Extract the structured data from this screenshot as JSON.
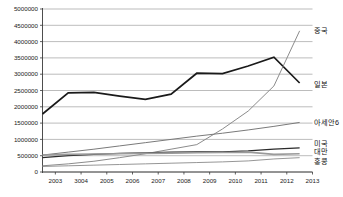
{
  "chart_data": {
    "type": "line",
    "title": "",
    "xlabel": "",
    "ylabel": "",
    "ylim": [
      0,
      5000000
    ],
    "xlim": [
      2002.5,
      2013.0
    ],
    "grid": true,
    "legend_position": "right-inline-labels",
    "ytick_labels": [
      "5000000",
      "4500000",
      "4000000",
      "3500000",
      "3000000",
      "2500000",
      "2000000",
      "1500000",
      "1000000",
      "500000",
      "0"
    ],
    "ytick_values": [
      5000000,
      4500000,
      4000000,
      3500000,
      3000000,
      2500000,
      2000000,
      1500000,
      1000000,
      500000,
      0
    ],
    "xtick_labels": [
      "2003",
      "3004",
      "2005",
      "2006",
      "2007",
      "2008",
      "2009",
      "2010",
      "2011",
      "2012",
      "2013"
    ],
    "xtick_values": [
      2003,
      2004,
      2005,
      2006,
      2007,
      2008,
      2009,
      2010,
      2011,
      2012,
      2013
    ],
    "x": [
      2002.5,
      2003.5,
      2004.5,
      2005.5,
      2006.5,
      2007.5,
      2008.5,
      2009.5,
      2010.5,
      2011.5,
      2012.5
    ],
    "series": [
      {
        "name": "일본",
        "color": "#1a1a1a",
        "width": 1.7,
        "label_x": 2013.0,
        "label_y": 2700000,
        "values": [
          1780000,
          2430000,
          2440000,
          2330000,
          2230000,
          2390000,
          3030000,
          3020000,
          3250000,
          3520000,
          2730000
        ]
      },
      {
        "name": "중국",
        "color": "#8c8c8c",
        "width": 1.0,
        "label_x": 2013.0,
        "label_y": 4330000,
        "values": [
          190000,
          250000,
          330000,
          440000,
          560000,
          700000,
          840000,
          1320000,
          1870000,
          2640000,
          4330000
        ]
      },
      {
        "name": "아세안6",
        "color": "#7a7a7a",
        "width": 1.0,
        "label_x": 2013.0,
        "label_y": 1520000,
        "values": [
          520000,
          610000,
          700000,
          800000,
          900000,
          1000000,
          1100000,
          1190000,
          1290000,
          1400000,
          1520000
        ]
      },
      {
        "name": "미국",
        "color": "#2b2b2b",
        "width": 1.2,
        "label_x": 2013.0,
        "label_y": 880000,
        "values": [
          440000,
          500000,
          540000,
          570000,
          590000,
          610000,
          620000,
          620000,
          650000,
          700000,
          740000
        ]
      },
      {
        "name": "대만",
        "color": "#9a9a9a",
        "width": 1.6,
        "label_x": 2013.0,
        "label_y": 620000,
        "values": [
          520000,
          540000,
          550000,
          560000,
          570000,
          580000,
          590000,
          600000,
          610000,
          540000,
          560000
        ]
      },
      {
        "name": "홍콩",
        "color": "#8a8a8a",
        "width": 0.9,
        "label_x": 2013.0,
        "label_y": 330000,
        "values": [
          170000,
          190000,
          210000,
          230000,
          250000,
          270000,
          290000,
          310000,
          340000,
          400000,
          440000
        ]
      }
    ]
  }
}
